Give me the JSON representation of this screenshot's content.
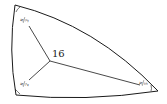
{
  "diagram": {
    "type": "spherical-triangle",
    "center_label": "16",
    "angles": [
      {
        "vertex": "top-left",
        "label": "π/3",
        "num": "π",
        "den": "3"
      },
      {
        "vertex": "bottom-left",
        "label": "π/2",
        "num": "π",
        "den": "2"
      },
      {
        "vertex": "right",
        "label": "π/5",
        "num": "π",
        "den": "5"
      }
    ],
    "stroke_color": "#1a1a1a"
  }
}
